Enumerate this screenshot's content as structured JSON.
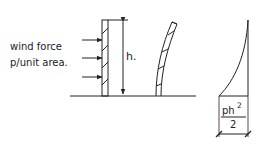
{
  "diagram": {
    "wind_label_line1": "wind force",
    "wind_label_line2": "p/unit area.",
    "height_label": "h.",
    "moment_numerator": "ph",
    "moment_exponent": "2",
    "moment_denominator": "2",
    "ink_color": "#222222"
  }
}
